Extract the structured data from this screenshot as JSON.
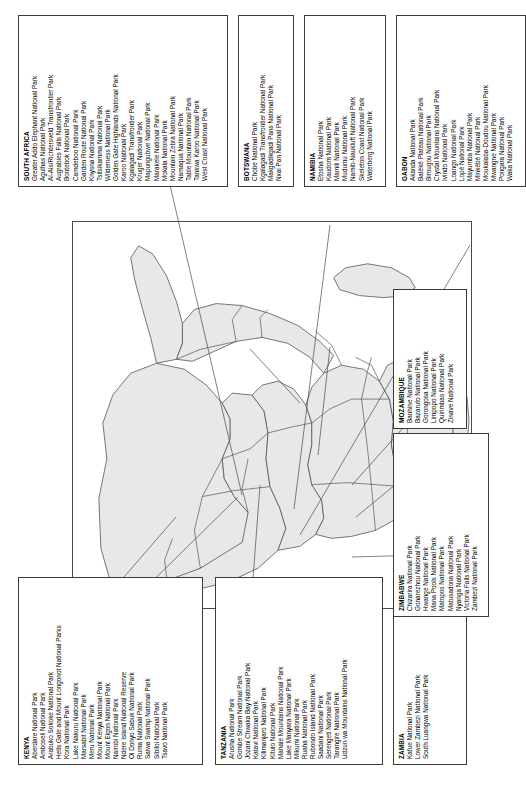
{
  "figure": {
    "map_label": "africa-outline-map"
  },
  "boxes": [
    {
      "id": "kenya",
      "country": "KENYA",
      "parks": [
        "Aberdare National Park",
        "Amboseli National Park",
        "Arabuko Sokoke National Park",
        "Hells Gate and Mount Longonot National Parks",
        "Kora National Park",
        "Lake Nakuru National Park",
        "Marsabit National Park",
        "Meru National Park",
        "Mount Kenya National Park",
        "Mount Elgon National Park",
        "Nairobi National Park",
        "Ndere Island National Reserve",
        "Ol Donyo Sabuk National Park",
        "Ruma National Park",
        "Saiwa Swamp National Park",
        "Sibiloi National Park",
        "Tsavo National Park"
      ]
    },
    {
      "id": "tanzania",
      "country": "TANZANIA",
      "parks": [
        "Arusha National Park",
        "Gombe Stream National Park",
        "Jozani Chwaka Bay National Park",
        "Katavi National Park",
        "Kilimanjaro National Park",
        "Kitulo National Park",
        "Mahale Mountains National Park",
        "Lake Manyara National Park",
        "Mikumi National Park",
        "Ruaha National Park",
        "Rubondo Island National Park",
        "Saadani National Park",
        "Serengeti National Park",
        "Tarangire National Park",
        "Udzun wa Mountains National Park"
      ]
    },
    {
      "id": "zambia",
      "country": "ZAMBIA",
      "parks": [
        "Kafue National Park",
        "Lower Zambezi National Park",
        "South Luangwa National Park"
      ]
    },
    {
      "id": "mozambique",
      "country": "MOZAMBIQUE",
      "parks": [
        "Banhine National Park",
        "Bazaruto National Park",
        "Gorongosa National Park",
        "Limpopo National Park",
        "Quirimbas National Park",
        "Zinave National Park"
      ]
    },
    {
      "id": "zimbabwe",
      "country": "ZIMBABWE",
      "parks": [
        "Chizarira National Park",
        "Gonarezhou National Park",
        "Hwange National Park",
        "Mana Pools National Park",
        "Matopos National Park",
        "Matusadona National Park",
        "Nyanga National Park",
        "Victoria Falls National Park",
        "Zambezi National Park"
      ]
    },
    {
      "id": "south-africa",
      "country": "SOUTH AFRICA",
      "parks": [
        "Greater Addo Elephant National Park",
        "Agulhas National Park",
        "Ai-Ais/Richtersveld Transfrontier Park",
        "Augrabies Falls National Park",
        "Bontebok National Park",
        "Camdeboo National Park",
        "Garden Route National Park",
        "Knysna National Park",
        "Tsitsikamma National Park",
        "Wilderness National Park",
        "Golden Gate Highlands National Park",
        "Karoo National Park",
        "Kgalagadi Transfrontier Park",
        "Kruger National Park",
        "Mapungubwe National Park",
        "Marakele National Park",
        "Mokala National Park",
        "Mountain Zebra National Park",
        "Namaqua National Park",
        "Table Mountain National Park",
        "Tankwa Karoo National Park",
        "West Coast National Park"
      ]
    },
    {
      "id": "botswana",
      "country": "BOTSWANA",
      "parks": [
        "Chobe National Park",
        "Kgalagadi Transfrontier National Park",
        "Makgadikgadi Pans National Park",
        "Nxai Pan National Park"
      ]
    },
    {
      "id": "namibia",
      "country": "NAMIBIA",
      "parks": [
        "Etosha National Park",
        "Kaudom National Park",
        "Mamili National Park",
        "Mudumu National Park",
        "Namib-Naukluft National Park",
        "Skeleton Coast National Park",
        "Waterberg National Park"
      ]
    },
    {
      "id": "gabon",
      "country": "GABON",
      "parks": [
        "Akanda National Park",
        "Batéké Plateau National Park",
        "Birougou National Park",
        "Crystal Mountains National Park",
        "Ivindo National Park",
        "Loango National Park",
        "Lopé National Park",
        "Mayumba National Park",
        "Minkébé National Park",
        "Moukalaba-Doudou National Park",
        "Mwangne National Park",
        "Pongara National Park",
        "Waka National Park"
      ]
    }
  ]
}
